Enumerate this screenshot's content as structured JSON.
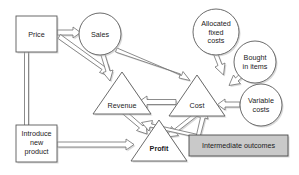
{
  "diagram": {
    "colors": {
      "background": "#ffffff",
      "shape_stroke": "#5a5a5a",
      "shape_fill": "#ffffff",
      "highlight_fill": "#c9c9c9",
      "arrow_stroke": "#6e6e6e",
      "shadow": "#b9b9b9",
      "text": "#1b1b1b"
    },
    "nodes": [
      {
        "id": "price",
        "label": "Price",
        "shape": "rectangle",
        "fill": "white"
      },
      {
        "id": "sales",
        "label": "Sales",
        "shape": "circle",
        "fill": "white"
      },
      {
        "id": "allocated-fixed-costs",
        "label_line1": "Allocated",
        "label_line2": "fixed",
        "label_line3": "costs",
        "shape": "circle",
        "fill": "white"
      },
      {
        "id": "bought-in-items",
        "label_line1": "Bought",
        "label_line2": "in items",
        "shape": "circle",
        "fill": "white"
      },
      {
        "id": "variable-costs",
        "label_line1": "Variable",
        "label_line2": "costs",
        "shape": "circle",
        "fill": "white"
      },
      {
        "id": "revenue",
        "label": "Revenue",
        "shape": "triangle",
        "fill": "white"
      },
      {
        "id": "cost",
        "label": "Cost",
        "shape": "triangle",
        "fill": "white"
      },
      {
        "id": "profit",
        "label": "Profit",
        "shape": "triangle",
        "fill": "white",
        "bold": true
      },
      {
        "id": "introduce-new-product",
        "label_line1": "Introduce",
        "label_line2": "new",
        "label_line3": "product",
        "shape": "rectangle",
        "fill": "white"
      },
      {
        "id": "intermediate-outcomes",
        "label": "Intermediate outcomes",
        "shape": "rectangle",
        "fill": "gray"
      }
    ],
    "edges": [
      {
        "from": "price",
        "to": "sales"
      },
      {
        "from": "price",
        "to": "revenue"
      },
      {
        "from": "introduce-new-product",
        "to": "price"
      },
      {
        "from": "introduce-new-product",
        "to": "profit"
      },
      {
        "from": "sales",
        "to": "revenue"
      },
      {
        "from": "sales",
        "to": "cost"
      },
      {
        "from": "allocated-fixed-costs",
        "to": "cost"
      },
      {
        "from": "bought-in-items",
        "to": "cost"
      },
      {
        "from": "variable-costs",
        "to": "cost"
      },
      {
        "from": "cost",
        "to": "revenue"
      },
      {
        "from": "revenue",
        "to": "profit"
      },
      {
        "from": "cost",
        "to": "profit"
      },
      {
        "from": "intermediate-outcomes",
        "to": "cost"
      },
      {
        "from": "intermediate-outcomes",
        "to": "revenue"
      }
    ]
  }
}
